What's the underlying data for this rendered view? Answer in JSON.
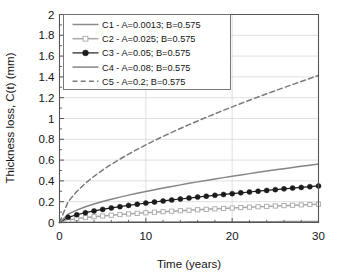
{
  "chart_data": {
    "type": "line",
    "title": "",
    "xlabel": "Time (years)",
    "ylabel": "Thickness loss, C(t) (mm)",
    "xlim": [
      0,
      30
    ],
    "ylim": [
      0,
      2
    ],
    "xticks": [
      0,
      10,
      20,
      30
    ],
    "xtick_labels": [
      "0",
      "10",
      "20",
      "30"
    ],
    "xminor_step": 2,
    "yticks": [
      0,
      0.2,
      0.4,
      0.6,
      0.8,
      1,
      1.2,
      1.4,
      1.6,
      1.8,
      2
    ],
    "ytick_labels": [
      "0",
      "0.2",
      "0.4",
      "0.6",
      "0.8",
      "1",
      "1.2",
      "1.4",
      "1.6",
      "1.8",
      "2"
    ],
    "grid": "horizontal-and-vertical-major",
    "legend_position": "upper-left-inside",
    "model": "C(t) = A * t^B",
    "x": [
      0,
      1,
      2,
      3,
      4,
      5,
      6,
      7,
      8,
      9,
      10,
      11,
      12,
      13,
      14,
      15,
      16,
      17,
      18,
      19,
      20,
      21,
      22,
      23,
      24,
      25,
      26,
      27,
      28,
      29,
      30
    ],
    "series": [
      {
        "name": "C1",
        "label": "C1 - A=0.0013; B=0.575",
        "A": 0.0013,
        "B": 0.575,
        "color": "#8c8c8c",
        "style": "solid",
        "marker": "none",
        "values": [
          0,
          0.0013,
          0.0019,
          0.0024,
          0.0029,
          0.0032,
          0.0036,
          0.0039,
          0.0043,
          0.0046,
          0.0049,
          0.0052,
          0.0054,
          0.0057,
          0.0059,
          0.0062,
          0.0064,
          0.0067,
          0.0069,
          0.0071,
          0.0073,
          0.0076,
          0.0078,
          0.008,
          0.0082,
          0.0084,
          0.0086,
          0.0088,
          0.009,
          0.0091,
          0.0093
        ]
      },
      {
        "name": "C2",
        "label": "C2 - A=0.025; B=0.575",
        "A": 0.025,
        "B": 0.575,
        "color": "#a8a8a8",
        "style": "solid",
        "marker": "open-square",
        "values": [
          0,
          0.025,
          0.0372,
          0.0471,
          0.0555,
          0.063,
          0.0699,
          0.0763,
          0.0824,
          0.0881,
          0.0935,
          0.0988,
          0.1038,
          0.1087,
          0.1134,
          0.118,
          0.1225,
          0.1268,
          0.1311,
          0.1353,
          0.1393,
          0.1433,
          0.1472,
          0.1511,
          0.1549,
          0.1586,
          0.1622,
          0.1658,
          0.1694,
          0.1729,
          0.1763
        ]
      },
      {
        "name": "C3",
        "label": "C3 -  A=0.05; B=0.575",
        "A": 0.05,
        "B": 0.575,
        "color": "#1c1c1c",
        "style": "solid",
        "marker": "filled-circle",
        "values": [
          0,
          0.05,
          0.0745,
          0.0943,
          0.1111,
          0.1261,
          0.1398,
          0.1525,
          0.1645,
          0.1758,
          0.1866,
          0.197,
          0.207,
          0.2167,
          0.2261,
          0.2352,
          0.2441,
          0.2528,
          0.2612,
          0.2695,
          0.2776,
          0.2856,
          0.2934,
          0.3011,
          0.3086,
          0.3161,
          0.3234,
          0.3306,
          0.3377,
          0.3447,
          0.3517
        ]
      },
      {
        "name": "C4",
        "label": "C4 - A=0.08; B=0.575",
        "A": 0.08,
        "B": 0.575,
        "color": "#858585",
        "style": "solid",
        "marker": "none",
        "values": [
          0,
          0.08,
          0.1192,
          0.1509,
          0.1777,
          0.2017,
          0.2236,
          0.2439,
          0.2631,
          0.2812,
          0.2985,
          0.3151,
          0.3311,
          0.3466,
          0.3617,
          0.3763,
          0.3906,
          0.4045,
          0.4182,
          0.4315,
          0.4446,
          0.4574,
          0.47,
          0.4824,
          0.4946,
          0.5066,
          0.5174,
          0.5289,
          0.5403,
          0.5515,
          0.5627
        ]
      },
      {
        "name": "C5",
        "label": "C5 - A=0.2; B=0.575",
        "A": 0.2,
        "B": 0.575,
        "color": "#7a7a7a",
        "style": "dashed",
        "marker": "none",
        "values": [
          0,
          0.2,
          0.2981,
          0.3772,
          0.4443,
          0.5042,
          0.559,
          0.6099,
          0.6577,
          0.703,
          0.7463,
          0.7878,
          0.8279,
          0.8666,
          0.9042,
          0.9407,
          0.9764,
          1.0113,
          1.0454,
          1.0788,
          1.1116,
          1.1438,
          1.1755,
          1.2067,
          1.2374,
          1.2677,
          1.2976,
          1.3271,
          1.3562,
          1.385,
          1.4134
        ]
      }
    ]
  }
}
